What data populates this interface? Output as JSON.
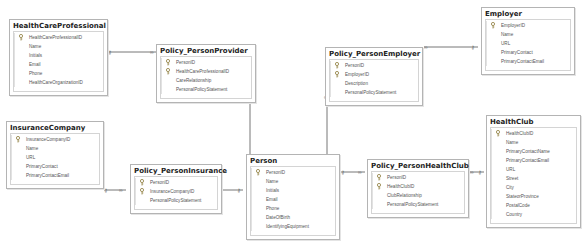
{
  "diagram": {
    "tables": [
      {
        "id": "hcp",
        "name": "HealthCareProfessional",
        "columns": [
          {
            "name": "HealthCareProfessionalID",
            "pk": true
          },
          {
            "name": "Name",
            "pk": false
          },
          {
            "name": "Initials",
            "pk": false
          },
          {
            "name": "Email",
            "pk": false
          },
          {
            "name": "Phone",
            "pk": false
          },
          {
            "name": "HealthCareOrganizationID",
            "pk": false
          }
        ]
      },
      {
        "id": "ppp",
        "name": "Policy_PersonProvider",
        "columns": [
          {
            "name": "PersonID",
            "pk": true
          },
          {
            "name": "HealthCareProfessionalID",
            "pk": true
          },
          {
            "name": "CareRelationship",
            "pk": false
          },
          {
            "name": "PersonalPolicyStatement",
            "pk": false
          }
        ]
      },
      {
        "id": "ppe",
        "name": "Policy_PersonEmployer",
        "columns": [
          {
            "name": "PersonID",
            "pk": true
          },
          {
            "name": "EmployerID",
            "pk": true
          },
          {
            "name": "Description",
            "pk": false
          },
          {
            "name": "PersonalPolicyStatement",
            "pk": false
          }
        ]
      },
      {
        "id": "emp",
        "name": "Employer",
        "columns": [
          {
            "name": "EmployerID",
            "pk": true
          },
          {
            "name": "Name",
            "pk": false
          },
          {
            "name": "URL",
            "pk": false
          },
          {
            "name": "PrimaryContact",
            "pk": false
          },
          {
            "name": "PrimaryContactEmail",
            "pk": false
          }
        ]
      },
      {
        "id": "ins",
        "name": "InsuranceCompany",
        "columns": [
          {
            "name": "InsuranceCompanyID",
            "pk": true
          },
          {
            "name": "Name",
            "pk": false
          },
          {
            "name": "URL",
            "pk": false
          },
          {
            "name": "PrimaryContact",
            "pk": false
          },
          {
            "name": "PrimaryContactEmail",
            "pk": false
          }
        ]
      },
      {
        "id": "ppi",
        "name": "Policy_PersonInsurance",
        "columns": [
          {
            "name": "PersonID",
            "pk": true
          },
          {
            "name": "InsuranceCompanyID",
            "pk": true
          },
          {
            "name": "PersonalPolicyStatement",
            "pk": false
          }
        ]
      },
      {
        "id": "per",
        "name": "Person",
        "columns": [
          {
            "name": "PersonID",
            "pk": true
          },
          {
            "name": "Name",
            "pk": false
          },
          {
            "name": "Initials",
            "pk": false
          },
          {
            "name": "Email",
            "pk": false
          },
          {
            "name": "Phone",
            "pk": false
          },
          {
            "name": "DateOfBirth",
            "pk": false
          },
          {
            "name": "IdentifyingEquipment",
            "pk": false
          }
        ]
      },
      {
        "id": "phc",
        "name": "Policy_PersonHealthClub",
        "columns": [
          {
            "name": "PersonID",
            "pk": true
          },
          {
            "name": "HealthClubID",
            "pk": true
          },
          {
            "name": "ClubRelationship",
            "pk": false
          },
          {
            "name": "PersonalPolicyStatement",
            "pk": false
          }
        ]
      },
      {
        "id": "hc",
        "name": "HealthClub",
        "columns": [
          {
            "name": "HealthClubID",
            "pk": true
          },
          {
            "name": "Name",
            "pk": false
          },
          {
            "name": "PrimaryContactName",
            "pk": false
          },
          {
            "name": "PrimaryContactEmail",
            "pk": false
          },
          {
            "name": "URL",
            "pk": false
          },
          {
            "name": "Street",
            "pk": false
          },
          {
            "name": "City",
            "pk": false
          },
          {
            "name": "StateorProvince",
            "pk": false
          },
          {
            "name": "PostalCode",
            "pk": false
          },
          {
            "name": "Country",
            "pk": false
          }
        ]
      }
    ],
    "relationships": [
      {
        "from": "HealthCareProfessional",
        "to": "Policy_PersonProvider",
        "one": "key",
        "many": "∞"
      },
      {
        "from": "Person",
        "to": "Policy_PersonProvider",
        "one": "key",
        "many": "∞"
      },
      {
        "from": "Person",
        "to": "Policy_PersonEmployer",
        "one": "key",
        "many": "∞"
      },
      {
        "from": "Employer",
        "to": "Policy_PersonEmployer",
        "one": "key",
        "many": "∞"
      },
      {
        "from": "InsuranceCompany",
        "to": "Policy_PersonInsurance",
        "one": "key",
        "many": "∞"
      },
      {
        "from": "Person",
        "to": "Policy_PersonInsurance",
        "one": "key",
        "many": "∞"
      },
      {
        "from": "Person",
        "to": "Policy_PersonHealthClub",
        "one": "key",
        "many": "∞"
      },
      {
        "from": "HealthClub",
        "to": "Policy_PersonHealthClub",
        "one": "key",
        "many": "∞"
      }
    ],
    "symbols": {
      "many": "∞",
      "one": "⚷"
    }
  }
}
